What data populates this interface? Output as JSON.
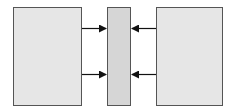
{
  "diagram": {
    "colors": {
      "background": "#ffffff",
      "box_fill": "#e6e6e6",
      "center_fill": "#d6d6d6",
      "stroke": "#555555",
      "arrow": "#111111"
    },
    "nodes": [
      {
        "id": "left-block",
        "label": "",
        "x": 13,
        "y": 7,
        "w": 68,
        "h": 98
      },
      {
        "id": "center-block",
        "label": "",
        "x": 107,
        "y": 7,
        "w": 23,
        "h": 98
      },
      {
        "id": "right-block",
        "label": "",
        "x": 156,
        "y": 7,
        "w": 66,
        "h": 98
      }
    ],
    "edges": [
      {
        "from": "left-block",
        "to": "center-block",
        "y": 28
      },
      {
        "from": "left-block",
        "to": "center-block",
        "y": 74
      },
      {
        "from": "right-block",
        "to": "center-block",
        "y": 28
      },
      {
        "from": "right-block",
        "to": "center-block",
        "y": 74
      }
    ]
  }
}
